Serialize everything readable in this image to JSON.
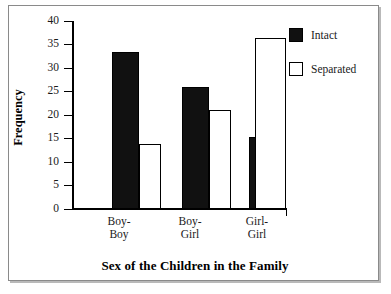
{
  "chart_data": {
    "type": "bar",
    "title": "",
    "xlabel": "Sex of the Children in the Family",
    "ylabel": "Frequency",
    "categories": [
      "Boy-Boy",
      "Boy-Girl",
      "Girl-Girl"
    ],
    "category_lines": [
      [
        "Boy-",
        "Boy"
      ],
      [
        "Boy-",
        "Girl"
      ],
      [
        "Girl-",
        "Girl"
      ]
    ],
    "series": [
      {
        "name": "Intact",
        "values": [
          33.5,
          26.0,
          15.3
        ],
        "color": "#111111",
        "fill": "solid"
      },
      {
        "name": "Separated",
        "values": [
          13.8,
          21.1,
          36.3
        ],
        "color": "#ffffff",
        "fill": "open"
      }
    ],
    "ylim": [
      0,
      40
    ],
    "ytick_values": [
      0,
      5,
      10,
      15,
      20,
      25,
      30,
      35,
      40
    ],
    "ytick_labels": [
      "0",
      "5",
      "10",
      "15",
      "20",
      "25",
      "30",
      "35",
      "40"
    ],
    "grid": false,
    "legend_position": "top-right",
    "legend_entries": [
      "Intact",
      "Separated"
    ]
  },
  "axes": {
    "y_title": "Frequency",
    "x_title": "Sex of the Children in the Family"
  },
  "legend": {
    "items": [
      {
        "label": "Intact",
        "swatch": "filled-square-icon"
      },
      {
        "label": "Separated",
        "swatch": "open-square-icon"
      }
    ]
  }
}
